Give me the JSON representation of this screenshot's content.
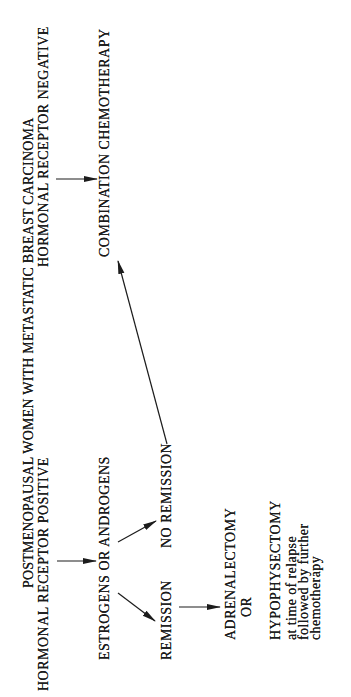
{
  "diagram": {
    "type": "flowchart",
    "title": "POSTMENOPAUSAL WOMEN WITH METASTATIC BREAST CARCINOMA",
    "nodes": {
      "receptor_positive": "HORMONAL RECEPTOR POSITIVE",
      "receptor_negative": "HORMONAL RECEPTOR NEGATIVE",
      "estrogens_androgens": "ESTROGENS OR ANDROGENS",
      "combination_chemotherapy": "COMBINATION CHEMOTHERAPY",
      "remission": "REMISSION",
      "no_remission": "NO REMISSION",
      "adrenalectomy": "ADRENALECTOMY",
      "or_connector": "OR",
      "hypophysectomy": "HYPOPHYSECTOMY",
      "note_line1": "at time of relapse",
      "note_line2": "followed by further",
      "note_line3": "chemotherapy"
    },
    "edges": [
      {
        "from": "HORMONAL RECEPTOR POSITIVE",
        "to": "ESTROGENS OR ANDROGENS"
      },
      {
        "from": "HORMONAL RECEPTOR NEGATIVE",
        "to": "COMBINATION CHEMOTHERAPY"
      },
      {
        "from": "ESTROGENS OR ANDROGENS",
        "to": "REMISSION"
      },
      {
        "from": "ESTROGENS OR ANDROGENS",
        "to": "NO REMISSION"
      },
      {
        "from": "NO REMISSION",
        "to": "COMBINATION CHEMOTHERAPY"
      },
      {
        "from": "REMISSION",
        "to": "ADRENALECTOMY OR HYPOPHYSECTOMY"
      }
    ],
    "colors": {
      "ink": "#1c1c1c",
      "paper": "#ffffff"
    }
  }
}
